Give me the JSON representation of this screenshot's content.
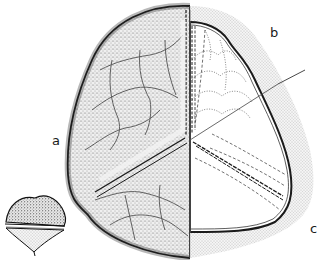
{
  "figure": {
    "type": "scientific-illustration",
    "labels": [
      {
        "id": "a",
        "text": "a",
        "x": 52,
        "y": 134
      },
      {
        "id": "b",
        "text": "b",
        "x": 270,
        "y": 26
      },
      {
        "id": "c",
        "text": "c",
        "x": 310,
        "y": 222
      }
    ],
    "colors": {
      "ink": "#1a1a1a",
      "stipple_dark": "#555555",
      "stipple_light": "#bdbdbd",
      "paper": "#ffffff"
    },
    "inset": {
      "description": "small lateral view of spore",
      "x": 2,
      "y": 195,
      "w": 65,
      "h": 60
    }
  }
}
